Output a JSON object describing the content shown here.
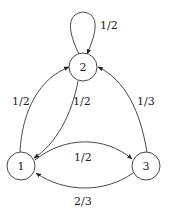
{
  "diagram": {
    "type": "markov-chain",
    "nodes": [
      {
        "id": "1",
        "label": "1"
      },
      {
        "id": "2",
        "label": "2"
      },
      {
        "id": "3",
        "label": "3"
      }
    ],
    "edges": [
      {
        "from": "2",
        "to": "2",
        "label": "1/2"
      },
      {
        "from": "1",
        "to": "2",
        "label": "1/2"
      },
      {
        "from": "2",
        "to": "1",
        "label": "1/2"
      },
      {
        "from": "3",
        "to": "2",
        "label": "1/3"
      },
      {
        "from": "1",
        "to": "3",
        "label": "1/2"
      },
      {
        "from": "3",
        "to": "1",
        "label": "2/3"
      }
    ]
  }
}
